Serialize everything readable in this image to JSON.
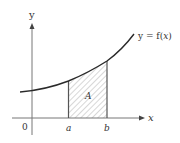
{
  "diagram": {
    "axes": {
      "x_label": "x",
      "y_label": "y",
      "origin_label": "0"
    },
    "curve": {
      "label": "y = f(x)",
      "label_prefix": "y = f(",
      "label_var": "x",
      "label_suffix": ")"
    },
    "region": {
      "label": "A",
      "left_bound_label": "a",
      "right_bound_label": "b",
      "fill": "hatched"
    },
    "colors": {
      "axis": "#777777",
      "curve": "#333333",
      "bounds": "#555555",
      "hatch": "#999999",
      "text": "#333333"
    }
  }
}
